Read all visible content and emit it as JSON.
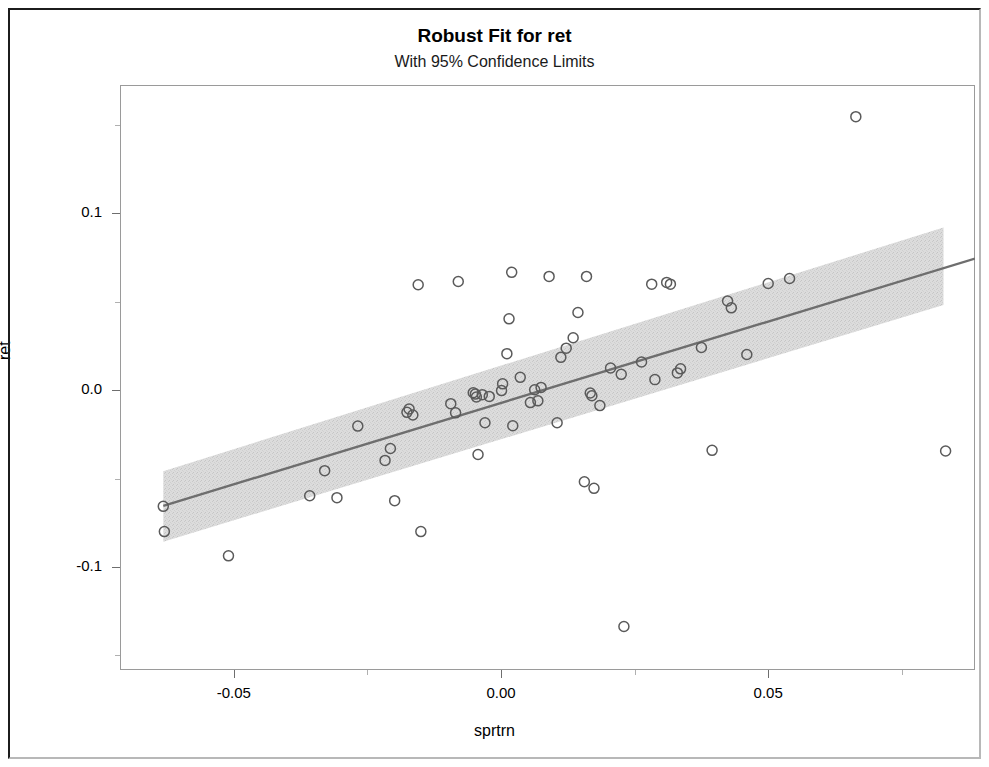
{
  "chart_data": {
    "type": "scatter",
    "title": "Robust Fit for ret",
    "subtitle": "With 95% Confidence Limits",
    "xlabel": "sprtrn",
    "ylabel": "ret",
    "xlim": [
      -0.0713,
      0.0887
    ],
    "ylim": [
      -0.1583,
      0.1727
    ],
    "xticks": [
      -0.05,
      0.0,
      0.05
    ],
    "xtick_labels": [
      "-0.05",
      "0.00",
      "0.05"
    ],
    "yticks": [
      0.1,
      0.0,
      -0.1
    ],
    "ytick_labels": [
      "0.1",
      "0.0",
      "-0.1"
    ],
    "x_minor_ticks": [
      -0.075,
      -0.025,
      0.025,
      0.075
    ],
    "y_minor_ticks": [
      0.15,
      0.05,
      -0.05,
      -0.15
    ],
    "grid": false,
    "legend": false,
    "marker": "open-circle",
    "marker_color": "#5a5a5a",
    "fit_line_color": "#6e6e6e",
    "confidence_band_color": "#d6d6d6",
    "confidence_level": "95%",
    "fit": {
      "type": "robust-linear",
      "x_start": -0.0632,
      "x_end": 0.0887,
      "y_start": -0.0654,
      "y_end": 0.0745
    },
    "confidence_band": {
      "x_start": -0.0632,
      "x_end": 0.0828,
      "lower_start": -0.0857,
      "upper_start": -0.0458,
      "lower_end": 0.0482,
      "upper_end": 0.0921
    },
    "points": [
      {
        "x": -0.0632,
        "y": -0.0657
      },
      {
        "x": -0.063,
        "y": -0.08
      },
      {
        "x": -0.051,
        "y": -0.0937
      },
      {
        "x": -0.0358,
        "y": -0.0597
      },
      {
        "x": -0.033,
        "y": -0.0455
      },
      {
        "x": -0.0307,
        "y": -0.0608
      },
      {
        "x": -0.0268,
        "y": -0.0203
      },
      {
        "x": -0.0217,
        "y": -0.0397
      },
      {
        "x": -0.0207,
        "y": -0.033
      },
      {
        "x": -0.0199,
        "y": -0.0625
      },
      {
        "x": -0.0176,
        "y": -0.0125
      },
      {
        "x": -0.0172,
        "y": -0.0106
      },
      {
        "x": -0.0165,
        "y": -0.014
      },
      {
        "x": -0.0155,
        "y": 0.0597
      },
      {
        "x": -0.015,
        "y": -0.08
      },
      {
        "x": -0.0094,
        "y": -0.0076
      },
      {
        "x": -0.0085,
        "y": -0.0128
      },
      {
        "x": -0.008,
        "y": 0.0615
      },
      {
        "x": -0.0052,
        "y": -0.0014
      },
      {
        "x": -0.0048,
        "y": -0.0022
      },
      {
        "x": -0.0046,
        "y": -0.0038
      },
      {
        "x": -0.0043,
        "y": -0.0364
      },
      {
        "x": -0.0035,
        "y": -0.0025
      },
      {
        "x": -0.003,
        "y": -0.0184
      },
      {
        "x": -0.0022,
        "y": -0.0035
      },
      {
        "x": 0.0001,
        "y": -0.0002
      },
      {
        "x": 0.0003,
        "y": 0.0036
      },
      {
        "x": 0.0011,
        "y": 0.0207
      },
      {
        "x": 0.0015,
        "y": 0.0404
      },
      {
        "x": 0.002,
        "y": 0.0667
      },
      {
        "x": 0.0022,
        "y": -0.0201
      },
      {
        "x": 0.0036,
        "y": 0.0073
      },
      {
        "x": 0.0055,
        "y": -0.007
      },
      {
        "x": 0.0063,
        "y": 0.0003
      },
      {
        "x": 0.0069,
        "y": -0.006
      },
      {
        "x": 0.0075,
        "y": 0.0016
      },
      {
        "x": 0.009,
        "y": 0.0644
      },
      {
        "x": 0.0105,
        "y": -0.0184
      },
      {
        "x": 0.0112,
        "y": 0.0186
      },
      {
        "x": 0.0122,
        "y": 0.0238
      },
      {
        "x": 0.0135,
        "y": 0.0297
      },
      {
        "x": 0.0144,
        "y": 0.044
      },
      {
        "x": 0.0156,
        "y": -0.0518
      },
      {
        "x": 0.016,
        "y": 0.0644
      },
      {
        "x": 0.0167,
        "y": -0.0016
      },
      {
        "x": 0.017,
        "y": -0.0031
      },
      {
        "x": 0.0174,
        "y": -0.0555
      },
      {
        "x": 0.0185,
        "y": -0.0087
      },
      {
        "x": 0.0205,
        "y": 0.0126
      },
      {
        "x": 0.0225,
        "y": 0.009
      },
      {
        "x": 0.023,
        "y": -0.1337
      },
      {
        "x": 0.0263,
        "y": 0.016
      },
      {
        "x": 0.0282,
        "y": 0.06
      },
      {
        "x": 0.0288,
        "y": 0.006
      },
      {
        "x": 0.031,
        "y": 0.061
      },
      {
        "x": 0.0317,
        "y": 0.06
      },
      {
        "x": 0.033,
        "y": 0.0098
      },
      {
        "x": 0.0336,
        "y": 0.0121
      },
      {
        "x": 0.0375,
        "y": 0.0242
      },
      {
        "x": 0.0395,
        "y": -0.034
      },
      {
        "x": 0.0424,
        "y": 0.0505
      },
      {
        "x": 0.0431,
        "y": 0.0466
      },
      {
        "x": 0.046,
        "y": 0.0202
      },
      {
        "x": 0.05,
        "y": 0.0604
      },
      {
        "x": 0.054,
        "y": 0.0632
      },
      {
        "x": 0.0664,
        "y": 0.1548
      },
      {
        "x": 0.0832,
        "y": -0.0344
      }
    ]
  },
  "chart": {
    "title": "Robust Fit for ret",
    "subtitle": "With 95% Confidence Limits",
    "xlabel": "sprtrn",
    "ylabel": "ret"
  }
}
